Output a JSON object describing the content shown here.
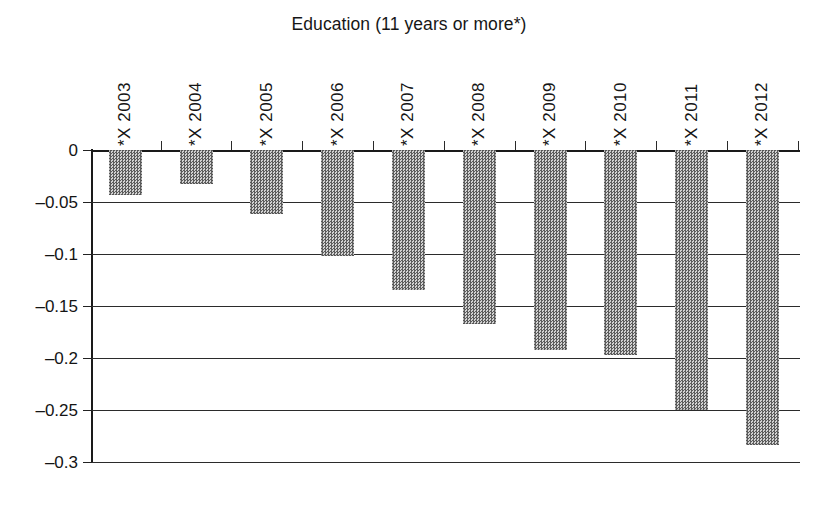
{
  "chart_data": {
    "type": "bar",
    "title": "Education (11 years or more*)",
    "subtitle": "",
    "xlabel": "",
    "ylabel": "",
    "categories": [
      "*X 2003",
      "*X 2004",
      "*X 2005",
      "*X 2006",
      "*X 2007",
      "*X 2008",
      "*X 2009",
      "*X 2010",
      "*X 2011",
      "*X 2012"
    ],
    "values": [
      -0.043,
      -0.033,
      -0.062,
      -0.102,
      -0.135,
      -0.167,
      -0.192,
      -0.197,
      -0.25,
      -0.284
    ],
    "ylim": [
      -0.3,
      0
    ],
    "ytick_labels": [
      "0",
      "–0.05",
      "–0.1",
      "–0.15",
      "–0.2",
      "–0.25",
      "–0.3"
    ],
    "ytick_values": [
      0,
      -0.05,
      -0.1,
      -0.15,
      -0.2,
      -0.25,
      -0.3
    ],
    "grid": true,
    "legend": null,
    "legend_position": "none",
    "bar_color": "#8f8f8f",
    "axis_color": "#1a1a1a",
    "background": "#ffffff",
    "orientation": "vertical"
  }
}
